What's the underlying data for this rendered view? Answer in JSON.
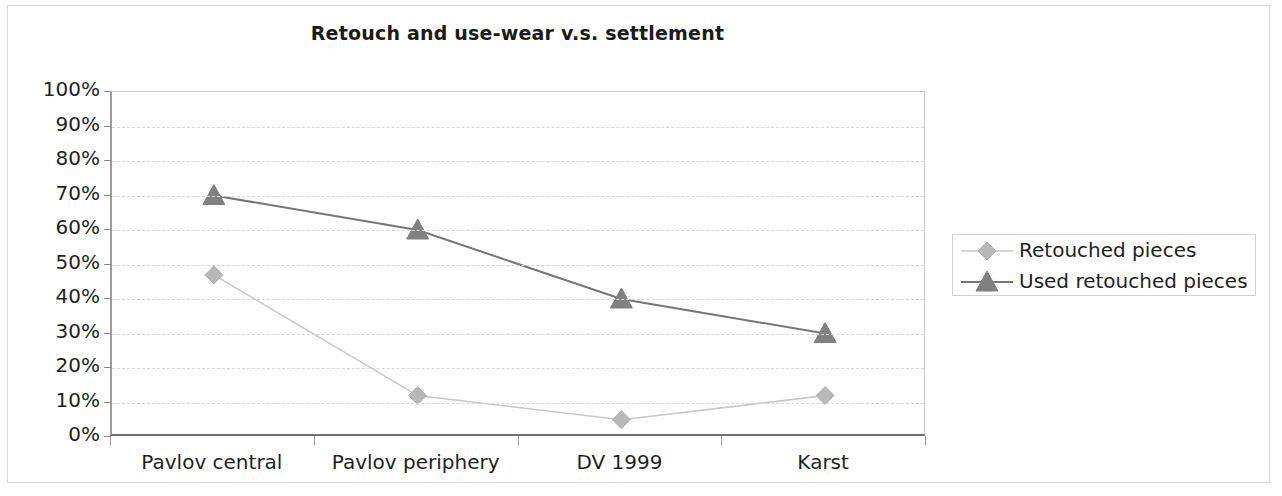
{
  "chart_data": {
    "type": "line",
    "title": "Retouch and use-wear v.s. settlement",
    "xlabel": "",
    "ylabel": "",
    "categories": [
      "Pavlov central",
      "Pavlov periphery",
      "DV 1999",
      "Karst"
    ],
    "series": [
      {
        "name": "Retouched pieces",
        "values": [
          47,
          12,
          5,
          12
        ],
        "marker": "diamond",
        "color": "#c8c8c8",
        "marker_color": "#b8b8b8"
      },
      {
        "name": "Used retouched pieces",
        "values": [
          70,
          60,
          40,
          30
        ],
        "marker": "triangle",
        "color": "#767676",
        "marker_color": "#808080"
      }
    ],
    "ylim": [
      0,
      100
    ],
    "ytick_labels": [
      "100%",
      "90%",
      "80%",
      "70%",
      "60%",
      "50%",
      "40%",
      "30%",
      "20%",
      "10%",
      "0%"
    ],
    "ytick_values": [
      100,
      90,
      80,
      70,
      60,
      50,
      40,
      30,
      20,
      10,
      0
    ],
    "grid": true,
    "grid_axis": "y",
    "legend_position": "right",
    "value_suffix": "%"
  },
  "legend": {
    "entries": [
      {
        "label": "Retouched pieces"
      },
      {
        "label": "Used retouched pieces"
      }
    ]
  }
}
